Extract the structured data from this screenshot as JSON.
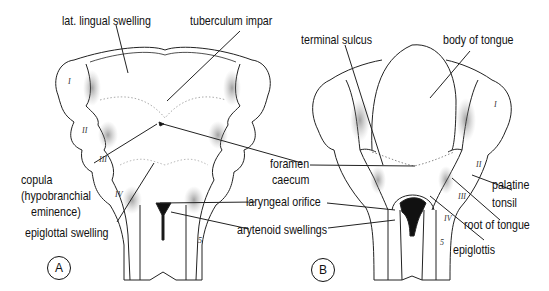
{
  "figure": {
    "panels": [
      {
        "id": "A",
        "badge": "A",
        "labels": {
          "lat_lingual_swelling": "lat. lingual swelling",
          "tuberculum_impar": "tuberculum impar",
          "copula_line1": "copula",
          "copula_line2": "(hypobranchial",
          "copula_line3": "eminence)",
          "epiglottal_swelling": "epiglottal swelling"
        },
        "arch_numerals": [
          "I",
          "II",
          "III",
          "IV"
        ],
        "extra_mark": "5"
      },
      {
        "id": "B",
        "badge": "B",
        "labels": {
          "terminal_sulcus": "terminal sulcus",
          "body_of_tongue": "body of tongue",
          "palatine_line1": "palatine",
          "palatine_line2": "tonsil",
          "root_of_tongue": "root of tongue",
          "epiglottis": "epiglottis"
        },
        "arch_numerals": [
          "I",
          "II",
          "III",
          "IV"
        ],
        "extra_mark": "5"
      }
    ],
    "shared_labels": {
      "foramen_line1": "foramen",
      "foramen_line2": "caecum",
      "laryngeal_orifice": "laryngeal orifice",
      "arytenoid_swellings": "arytenoid swellings"
    },
    "colors": {
      "ink": "#111111",
      "shade": "#9a9a9a",
      "background": "#ffffff"
    }
  }
}
